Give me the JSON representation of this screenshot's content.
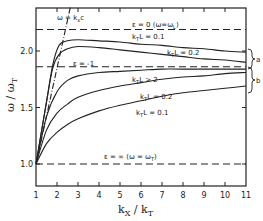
{
  "chart_data": {
    "type": "line",
    "title": "",
    "xlabel": "k_X / k_T",
    "ylabel": "ω / ω_T",
    "xlim": [
      1,
      11
    ],
    "ylim": [
      0.8,
      2.3
    ],
    "xticks": [
      1,
      2,
      3,
      4,
      5,
      6,
      7,
      8,
      9,
      10,
      11
    ],
    "yticks": [
      1.0,
      1.5,
      2.0
    ],
    "ytick_labels": [
      "1.0",
      "1.5",
      "2.0"
    ],
    "grid": false,
    "series": [
      {
        "name": "k_T L = 0.1 (a)",
        "group": "a",
        "style": "solid",
        "x": [
          1,
          1.5,
          1.8,
          2.1,
          2.5,
          3,
          4,
          5,
          6,
          7,
          8,
          9,
          10,
          11
        ],
        "y": [
          1.0,
          1.55,
          1.88,
          2.05,
          2.09,
          2.1,
          2.09,
          2.08,
          2.06,
          2.05,
          2.03,
          2.02,
          2.0,
          1.99
        ]
      },
      {
        "name": "k_T L = 0.2 (a)",
        "group": "a",
        "style": "solid",
        "x": [
          1,
          1.5,
          1.8,
          2.1,
          2.5,
          3,
          4,
          5,
          6,
          7,
          8,
          9,
          10,
          11
        ],
        "y": [
          1.0,
          1.55,
          1.85,
          1.97,
          2.02,
          2.04,
          2.03,
          2.01,
          1.99,
          1.97,
          1.95,
          1.93,
          1.92,
          1.9
        ]
      },
      {
        "name": "k_T L > 2",
        "group": "b",
        "style": "solid",
        "x": [
          1,
          1.5,
          2,
          2.5,
          3,
          4,
          5,
          6,
          7,
          8,
          11
        ],
        "y": [
          1.0,
          1.42,
          1.64,
          1.74,
          1.78,
          1.81,
          1.82,
          1.83,
          1.84,
          1.84,
          1.84
        ]
      },
      {
        "name": "k_T L = 0.2 (b)",
        "group": "b",
        "style": "solid",
        "x": [
          1,
          1.5,
          2,
          2.5,
          3,
          4,
          5,
          6,
          7,
          8,
          9,
          10,
          11
        ],
        "y": [
          1.0,
          1.3,
          1.45,
          1.53,
          1.59,
          1.65,
          1.69,
          1.72,
          1.75,
          1.77,
          1.78,
          1.8,
          1.81
        ]
      },
      {
        "name": "k_T L = 0.1 (b)",
        "group": "b",
        "style": "solid",
        "x": [
          1,
          1.5,
          2,
          2.5,
          3,
          4,
          5,
          6,
          7,
          8,
          9,
          10,
          11
        ],
        "y": [
          1.0,
          1.18,
          1.28,
          1.35,
          1.4,
          1.47,
          1.52,
          1.56,
          1.6,
          1.63,
          1.65,
          1.67,
          1.69
        ]
      },
      {
        "name": "ε = 0 (ω = ω_L)",
        "style": "dashed",
        "x": [
          1,
          11
        ],
        "y": [
          2.19,
          2.19
        ]
      },
      {
        "name": "ε = -1",
        "style": "dashed",
        "x": [
          1,
          11
        ],
        "y": [
          1.86,
          1.86
        ]
      },
      {
        "name": "ε = ∞ (ω = ω_T)",
        "style": "dashed",
        "x": [
          1,
          11
        ],
        "y": [
          1.0,
          1.0
        ]
      },
      {
        "name": "ω = k_x c",
        "style": "dash-dot",
        "x": [
          1,
          2.65
        ],
        "y": [
          1.0,
          2.4
        ]
      }
    ],
    "annotations": [
      {
        "text": "ω = k_x c",
        "x": 2.65,
        "y": 2.3
      },
      {
        "text": "ε = 0   (ω = ω_L)",
        "x": 5.3,
        "y": 2.21
      },
      {
        "text": "k_T L = 0.1",
        "x": 5.4,
        "y": 2.11
      },
      {
        "text": "k_T L = 0.2",
        "x": 7.3,
        "y": 2.0
      },
      {
        "text": "ε = -1",
        "x": 3.3,
        "y": 1.88
      },
      {
        "text": "k_T L > 2",
        "x": 5.4,
        "y": 1.73
      },
      {
        "text": "k_T L = 0.2",
        "x": 5.8,
        "y": 1.58
      },
      {
        "text": "k_T L = 0.1",
        "x": 5.7,
        "y": 1.43
      },
      {
        "text": "ε = ∞  (ω = ω_T)",
        "x": 5.0,
        "y": 1.04
      },
      {
        "text": "a",
        "x": 11.4,
        "y": 1.94
      },
      {
        "text": "b",
        "x": 11.4,
        "y": 1.76
      }
    ]
  },
  "labels": {
    "xlabel_main": "k",
    "xlabel_sub1": "X",
    "xlabel_slash": " / k",
    "xlabel_sub2": "T",
    "ylabel_main": "ω / ω",
    "ylabel_sub": "T",
    "line_label_ckx": "ω = k",
    "line_label_ckx_sub": "x",
    "line_label_ckx_end": "c",
    "eps0": "ε = 0   (ω=ω",
    "eps0_sub": "L",
    "eps0_end": ")",
    "epsm1": "ε = -1",
    "epsinf": "ε = ∞  (ω = ω",
    "epsinf_sub": "T",
    "epsinf_end": ")",
    "kl01a": "L = 0.1",
    "kl02a": "L = 0.2",
    "kl2": "L > 2",
    "kl02b": "L = 0.2",
    "kl01b": "L = 0.1",
    "k": "k",
    "T": "T",
    "brace_a": "a",
    "brace_b": "b"
  }
}
